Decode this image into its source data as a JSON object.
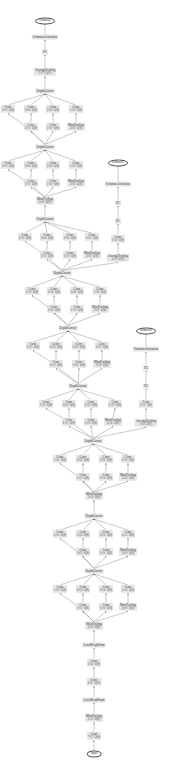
{
  "colors": {
    "node_fill": "#e6e6e6",
    "edge": "#777777",
    "text": "#333333"
  },
  "nodes": [
    {
      "id": "sm0",
      "type": "ellipse",
      "x": 45,
      "y": 21,
      "l1": "softmax2"
    },
    {
      "id": "sa0",
      "x": 45,
      "y": 37,
      "l1": "SoftmaxActivation"
    },
    {
      "id": "fc0",
      "x": 45,
      "y": 52,
      "l1": "FC"
    },
    {
      "id": "ap0",
      "x": 45,
      "y": 72,
      "l1": "AveragePooling",
      "l2": "7×7+1(V)"
    },
    {
      "id": "dc9",
      "x": 45,
      "y": 91,
      "l1": "DepthConcat"
    },
    {
      "id": "c9a",
      "x": 8,
      "y": 109,
      "l1": "Conv",
      "l2": "1×1+1(S)"
    },
    {
      "id": "c9b",
      "x": 31,
      "y": 109,
      "l1": "Conv",
      "l2": "3×3+1(S)"
    },
    {
      "id": "c9c",
      "x": 53,
      "y": 109,
      "l1": "Conv",
      "l2": "5×5+1(S)"
    },
    {
      "id": "c9d",
      "x": 76,
      "y": 109,
      "l1": "Conv",
      "l2": "1×1+1(S)"
    },
    {
      "id": "c9e",
      "x": 31,
      "y": 127,
      "l1": "Conv",
      "l2": "1×1+1(S)"
    },
    {
      "id": "c9f",
      "x": 53,
      "y": 127,
      "l1": "Conv",
      "l2": "1×1+1(S)"
    },
    {
      "id": "c9g",
      "x": 76,
      "y": 127,
      "l1": "MaxPooling",
      "l2": "3×3+1(S)"
    },
    {
      "id": "dc8",
      "x": 45,
      "y": 147,
      "l1": "DepthConcat"
    },
    {
      "id": "c8a",
      "x": 8,
      "y": 165,
      "l1": "Conv",
      "l2": "1×1+1(S)"
    },
    {
      "id": "c8b",
      "x": 31,
      "y": 165,
      "l1": "Conv",
      "l2": "3×3+1(S)"
    },
    {
      "id": "c8c",
      "x": 53,
      "y": 165,
      "l1": "Conv",
      "l2": "5×5+1(S)"
    },
    {
      "id": "c8d",
      "x": 76,
      "y": 165,
      "l1": "Conv",
      "l2": "1×1+1(S)"
    },
    {
      "id": "c8e",
      "x": 31,
      "y": 183,
      "l1": "Conv",
      "l2": "1×1+1(S)"
    },
    {
      "id": "c8f",
      "x": 53,
      "y": 183,
      "l1": "Conv",
      "l2": "1×1+1(S)"
    },
    {
      "id": "c8g",
      "x": 76,
      "y": 183,
      "l1": "MaxPooling",
      "l2": "3×3+1(S)"
    },
    {
      "id": "mp4",
      "x": 45,
      "y": 201,
      "l1": "MaxPooling",
      "l2": "3×3+2(S)"
    },
    {
      "id": "dc7",
      "x": 45,
      "y": 219,
      "l1": "DepthConcat"
    },
    {
      "id": "c7a",
      "x": 25,
      "y": 237,
      "l1": "Conv",
      "l2": "1×1+1(S)"
    },
    {
      "id": "c7b",
      "x": 47,
      "y": 237,
      "l1": "Conv",
      "l2": "3×3+1(S)"
    },
    {
      "id": "c7c",
      "x": 70,
      "y": 237,
      "l1": "Conv",
      "l2": "5×5+1(S)"
    },
    {
      "id": "c7d",
      "x": 92,
      "y": 237,
      "l1": "Conv",
      "l2": "1×1+1(S)"
    },
    {
      "id": "c7e",
      "x": 47,
      "y": 255,
      "l1": "Conv",
      "l2": "1×1+1(S)"
    },
    {
      "id": "c7f",
      "x": 70,
      "y": 255,
      "l1": "Conv",
      "l2": "1×1+1(S)"
    },
    {
      "id": "c7g",
      "x": 92,
      "y": 255,
      "l1": "MaxPooling",
      "l2": "3×3+1(S)"
    },
    {
      "id": "dc6",
      "x": 62,
      "y": 273,
      "l1": "DepthConcat"
    },
    {
      "id": "c6a",
      "x": 32,
      "y": 291,
      "l1": "Conv",
      "l2": "1×1+1(S)"
    },
    {
      "id": "c6b",
      "x": 54,
      "y": 291,
      "l1": "Conv",
      "l2": "3×3+1(S)"
    },
    {
      "id": "c6c",
      "x": 77,
      "y": 291,
      "l1": "Conv",
      "l2": "5×5+1(S)"
    },
    {
      "id": "c6d",
      "x": 100,
      "y": 291,
      "l1": "Conv",
      "l2": "1×1+1(S)"
    },
    {
      "id": "c6e",
      "x": 54,
      "y": 309,
      "l1": "Conv",
      "l2": "1×1+1(S)"
    },
    {
      "id": "c6f",
      "x": 77,
      "y": 309,
      "l1": "Conv",
      "l2": "1×1+1(S)"
    },
    {
      "id": "c6g",
      "x": 100,
      "y": 309,
      "l1": "MaxPooling",
      "l2": "3×3+1(S)"
    },
    {
      "id": "dc5",
      "x": 68,
      "y": 328,
      "l1": "DepthConcat"
    },
    {
      "id": "c5a",
      "x": 33,
      "y": 346,
      "l1": "Conv",
      "l2": "1×1+1(S)"
    },
    {
      "id": "c5b",
      "x": 56,
      "y": 346,
      "l1": "Conv",
      "l2": "3×3+1(S)"
    },
    {
      "id": "c5c",
      "x": 79,
      "y": 346,
      "l1": "Conv",
      "l2": "5×5+1(S)"
    },
    {
      "id": "c5d",
      "x": 102,
      "y": 346,
      "l1": "Conv",
      "l2": "1×1+1(S)"
    },
    {
      "id": "c5e",
      "x": 56,
      "y": 364,
      "l1": "Conv",
      "l2": "1×1+1(S)"
    },
    {
      "id": "c5f",
      "x": 79,
      "y": 364,
      "l1": "Conv",
      "l2": "1×1+1(S)"
    },
    {
      "id": "c5g",
      "x": 102,
      "y": 364,
      "l1": "MaxPooling",
      "l2": "3×3+1(S)"
    },
    {
      "id": "dc4",
      "x": 78,
      "y": 386,
      "l1": "DepthConcat"
    },
    {
      "id": "c4a",
      "x": 46,
      "y": 404,
      "l1": "Conv",
      "l2": "1×1+1(S)"
    },
    {
      "id": "c4b",
      "x": 69,
      "y": 404,
      "l1": "Conv",
      "l2": "3×3+1(S)"
    },
    {
      "id": "c4c",
      "x": 91,
      "y": 404,
      "l1": "Conv",
      "l2": "5×5+1(S)"
    },
    {
      "id": "c4d",
      "x": 115,
      "y": 404,
      "l1": "Conv",
      "l2": "1×1+1(S)"
    },
    {
      "id": "c4e",
      "x": 69,
      "y": 422,
      "l1": "Conv",
      "l2": "1×1+1(S)"
    },
    {
      "id": "c4f",
      "x": 91,
      "y": 422,
      "l1": "Conv",
      "l2": "1×1+1(S)"
    },
    {
      "id": "c4g",
      "x": 113,
      "y": 422,
      "l1": "MaxPooling",
      "l2": "3×3+1(S)"
    },
    {
      "id": "dc3",
      "x": 93,
      "y": 441,
      "l1": "DepthConcat"
    },
    {
      "id": "c3a",
      "x": 60,
      "y": 459,
      "l1": "Conv",
      "l2": "1×1+1(S)"
    },
    {
      "id": "c3b",
      "x": 83,
      "y": 459,
      "l1": "Conv",
      "l2": "3×3+1(S)"
    },
    {
      "id": "c3c",
      "x": 106,
      "y": 459,
      "l1": "Conv",
      "l2": "5×5+1(S)"
    },
    {
      "id": "c3d",
      "x": 128,
      "y": 459,
      "l1": "Conv",
      "l2": "1×1+1(S)"
    },
    {
      "id": "c3e",
      "x": 83,
      "y": 477,
      "l1": "Conv",
      "l2": "1×1+1(S)"
    },
    {
      "id": "c3f",
      "x": 106,
      "y": 477,
      "l1": "Conv",
      "l2": "1×1+1(S)"
    },
    {
      "id": "c3g",
      "x": 128,
      "y": 477,
      "l1": "MaxPooling",
      "l2": "3×3+1(S)"
    },
    {
      "id": "mp3",
      "x": 94,
      "y": 496,
      "l1": "MaxPooling",
      "l2": "3×3+2(S)"
    },
    {
      "id": "dc2",
      "x": 94,
      "y": 516,
      "l1": "DepthConcat"
    },
    {
      "id": "c2a",
      "x": 60,
      "y": 534,
      "l1": "Conv",
      "l2": "1×1+1(S)"
    },
    {
      "id": "c2b",
      "x": 83,
      "y": 534,
      "l1": "Conv",
      "l2": "3×3+1(S)"
    },
    {
      "id": "c2c",
      "x": 106,
      "y": 534,
      "l1": "Conv",
      "l2": "5×5+1(S)"
    },
    {
      "id": "c2d",
      "x": 128,
      "y": 534,
      "l1": "Conv",
      "l2": "1×1+1(S)"
    },
    {
      "id": "c2e",
      "x": 83,
      "y": 552,
      "l1": "Conv",
      "l2": "1×1+1(S)"
    },
    {
      "id": "c2f",
      "x": 106,
      "y": 552,
      "l1": "Conv",
      "l2": "1×1+1(S)"
    },
    {
      "id": "c2g",
      "x": 128,
      "y": 552,
      "l1": "MaxPooling",
      "l2": "3×3+1(S)"
    },
    {
      "id": "dc1",
      "x": 94,
      "y": 571,
      "l1": "DepthConcat"
    },
    {
      "id": "c1a",
      "x": 60,
      "y": 589,
      "l1": "Conv",
      "l2": "1×1+1(S)"
    },
    {
      "id": "c1b",
      "x": 83,
      "y": 589,
      "l1": "Conv",
      "l2": "3×3+1(S)"
    },
    {
      "id": "c1c",
      "x": 106,
      "y": 589,
      "l1": "Conv",
      "l2": "5×5+1(S)"
    },
    {
      "id": "c1d",
      "x": 128,
      "y": 589,
      "l1": "Conv",
      "l2": "1×1+1(S)"
    },
    {
      "id": "c1e",
      "x": 83,
      "y": 607,
      "l1": "Conv",
      "l2": "1×1+1(S)"
    },
    {
      "id": "c1f",
      "x": 106,
      "y": 607,
      "l1": "Conv",
      "l2": "1×1+1(S)"
    },
    {
      "id": "c1g",
      "x": 128,
      "y": 607,
      "l1": "MaxPooling",
      "l2": "3×3+1(S)"
    },
    {
      "id": "mp2",
      "x": 94,
      "y": 626,
      "l1": "MaxPooling",
      "l2": "3×3+2(S)"
    },
    {
      "id": "ln2",
      "x": 94,
      "y": 645,
      "l1": "LocalRespNorm"
    },
    {
      "id": "cv2",
      "x": 94,
      "y": 663,
      "l1": "Conv",
      "l2": "3×3+1(S)"
    },
    {
      "id": "cv1",
      "x": 94,
      "y": 682,
      "l1": "Conv",
      "l2": "1×1+1(V)"
    },
    {
      "id": "ln1",
      "x": 94,
      "y": 700,
      "l1": "LocalRespNorm"
    },
    {
      "id": "mp1",
      "x": 94,
      "y": 718,
      "l1": "MaxPooling",
      "l2": "3×3+2(S)"
    },
    {
      "id": "cv0",
      "x": 94,
      "y": 736,
      "l1": "Conv",
      "l2": "7×7+2(S)"
    },
    {
      "id": "in",
      "type": "ellipse",
      "x": 94,
      "y": 754,
      "l1": "input"
    },
    {
      "id": "sm1",
      "type": "ellipse",
      "x": 118,
      "y": 163,
      "l1": "softmax1"
    },
    {
      "id": "sa1",
      "x": 118,
      "y": 184,
      "l1": "SoftmaxActivation"
    },
    {
      "id": "fc1b",
      "x": 118,
      "y": 203,
      "l1": "FC"
    },
    {
      "id": "fc1a",
      "x": 118,
      "y": 221,
      "l1": "FC"
    },
    {
      "id": "cx1",
      "x": 118,
      "y": 239,
      "l1": "Conv",
      "l2": "1×1+1(S)"
    },
    {
      "id": "ax1",
      "x": 118,
      "y": 258,
      "l1": "AveragePooling",
      "l2": "5×5+3(V)"
    },
    {
      "id": "sm2",
      "type": "ellipse",
      "x": 146,
      "y": 331,
      "l1": "softmax0"
    },
    {
      "id": "sa2",
      "x": 146,
      "y": 349,
      "l1": "SoftmaxActivation"
    },
    {
      "id": "fc2b",
      "x": 146,
      "y": 368,
      "l1": "FC"
    },
    {
      "id": "fc2a",
      "x": 146,
      "y": 386,
      "l1": "FC"
    },
    {
      "id": "cx2",
      "x": 146,
      "y": 404,
      "l1": "Conv",
      "l2": "1×1+1(S)"
    },
    {
      "id": "ax2",
      "x": 146,
      "y": 423,
      "l1": "AveragePooling",
      "l2": "5×5+3(V)"
    }
  ],
  "edges": [
    [
      "in",
      "cv0"
    ],
    [
      "cv0",
      "mp1"
    ],
    [
      "mp1",
      "ln1"
    ],
    [
      "ln1",
      "cv1"
    ],
    [
      "cv1",
      "cv2"
    ],
    [
      "cv2",
      "ln2"
    ],
    [
      "ln2",
      "mp2"
    ],
    [
      "mp2",
      "c1a"
    ],
    [
      "mp2",
      "c1e"
    ],
    [
      "mp2",
      "c1f"
    ],
    [
      "mp2",
      "c1g"
    ],
    [
      "c1e",
      "c1b"
    ],
    [
      "c1f",
      "c1c"
    ],
    [
      "c1g",
      "c1d"
    ],
    [
      "c1a",
      "dc1"
    ],
    [
      "c1b",
      "dc1"
    ],
    [
      "c1c",
      "dc1"
    ],
    [
      "c1d",
      "dc1"
    ],
    [
      "dc1",
      "c2a"
    ],
    [
      "dc1",
      "c2e"
    ],
    [
      "dc1",
      "c2f"
    ],
    [
      "dc1",
      "c2g"
    ],
    [
      "c2e",
      "c2b"
    ],
    [
      "c2f",
      "c2c"
    ],
    [
      "c2g",
      "c2d"
    ],
    [
      "c2a",
      "dc2"
    ],
    [
      "c2b",
      "dc2"
    ],
    [
      "c2c",
      "dc2"
    ],
    [
      "c2d",
      "dc2"
    ],
    [
      "dc2",
      "mp3"
    ],
    [
      "mp3",
      "c3a"
    ],
    [
      "mp3",
      "c3e"
    ],
    [
      "mp3",
      "c3f"
    ],
    [
      "mp3",
      "c3g"
    ],
    [
      "c3e",
      "c3b"
    ],
    [
      "c3f",
      "c3c"
    ],
    [
      "c3g",
      "c3d"
    ],
    [
      "c3a",
      "dc3"
    ],
    [
      "c3b",
      "dc3"
    ],
    [
      "c3c",
      "dc3"
    ],
    [
      "c3d",
      "dc3"
    ],
    [
      "dc3",
      "c4a"
    ],
    [
      "dc3",
      "c4e"
    ],
    [
      "dc3",
      "c4f"
    ],
    [
      "dc3",
      "c4g"
    ],
    [
      "c4e",
      "c4b"
    ],
    [
      "c4f",
      "c4c"
    ],
    [
      "c4g",
      "c4d"
    ],
    [
      "c4a",
      "dc4"
    ],
    [
      "c4b",
      "dc4"
    ],
    [
      "c4c",
      "dc4"
    ],
    [
      "c4d",
      "dc4"
    ],
    [
      "dc3",
      "ax2"
    ],
    [
      "ax2",
      "cx2"
    ],
    [
      "cx2",
      "fc2a"
    ],
    [
      "fc2a",
      "fc2b"
    ],
    [
      "fc2b",
      "sa2"
    ],
    [
      "sa2",
      "sm2"
    ],
    [
      "dc4",
      "c5a"
    ],
    [
      "dc4",
      "c5e"
    ],
    [
      "dc4",
      "c5f"
    ],
    [
      "dc4",
      "c5g"
    ],
    [
      "c5e",
      "c5b"
    ],
    [
      "c5f",
      "c5c"
    ],
    [
      "c5g",
      "c5d"
    ],
    [
      "c5a",
      "dc5"
    ],
    [
      "c5b",
      "dc5"
    ],
    [
      "c5c",
      "dc5"
    ],
    [
      "c5d",
      "dc5"
    ],
    [
      "dc5",
      "c6a"
    ],
    [
      "dc5",
      "c6e"
    ],
    [
      "dc5",
      "c6f"
    ],
    [
      "dc5",
      "c6g"
    ],
    [
      "c6e",
      "c6b"
    ],
    [
      "c6f",
      "c6c"
    ],
    [
      "c6g",
      "c6d"
    ],
    [
      "c6a",
      "dc6"
    ],
    [
      "c6b",
      "dc6"
    ],
    [
      "c6c",
      "dc6"
    ],
    [
      "c6d",
      "dc6"
    ],
    [
      "dc6",
      "ax1"
    ],
    [
      "ax1",
      "cx1"
    ],
    [
      "cx1",
      "fc1a"
    ],
    [
      "fc1a",
      "fc1b"
    ],
    [
      "fc1b",
      "sa1"
    ],
    [
      "sa1",
      "sm1"
    ],
    [
      "dc6",
      "c7a"
    ],
    [
      "dc6",
      "c7e"
    ],
    [
      "dc6",
      "c7f"
    ],
    [
      "dc6",
      "c7g"
    ],
    [
      "c7e",
      "c7b"
    ],
    [
      "c7f",
      "c7c"
    ],
    [
      "c7g",
      "c7d"
    ],
    [
      "c7a",
      "dc7"
    ],
    [
      "c7b",
      "dc7"
    ],
    [
      "c7c",
      "dc7"
    ],
    [
      "c7d",
      "dc7"
    ],
    [
      "dc7",
      "mp4"
    ],
    [
      "mp4",
      "c8a"
    ],
    [
      "mp4",
      "c8e"
    ],
    [
      "mp4",
      "c8f"
    ],
    [
      "mp4",
      "c8g"
    ],
    [
      "c8e",
      "c8b"
    ],
    [
      "c8f",
      "c8c"
    ],
    [
      "c8g",
      "c8d"
    ],
    [
      "c8a",
      "dc8"
    ],
    [
      "c8b",
      "dc8"
    ],
    [
      "c8c",
      "dc8"
    ],
    [
      "c8d",
      "dc8"
    ],
    [
      "dc8",
      "c9a"
    ],
    [
      "dc8",
      "c9e"
    ],
    [
      "dc8",
      "c9f"
    ],
    [
      "dc8",
      "c9g"
    ],
    [
      "c9e",
      "c9b"
    ],
    [
      "c9f",
      "c9c"
    ],
    [
      "c9g",
      "c9d"
    ],
    [
      "c9a",
      "dc9"
    ],
    [
      "c9b",
      "dc9"
    ],
    [
      "c9c",
      "dc9"
    ],
    [
      "c9d",
      "dc9"
    ],
    [
      "dc9",
      "ap0"
    ],
    [
      "ap0",
      "fc0"
    ],
    [
      "fc0",
      "sa0"
    ],
    [
      "sa0",
      "sm0"
    ]
  ]
}
